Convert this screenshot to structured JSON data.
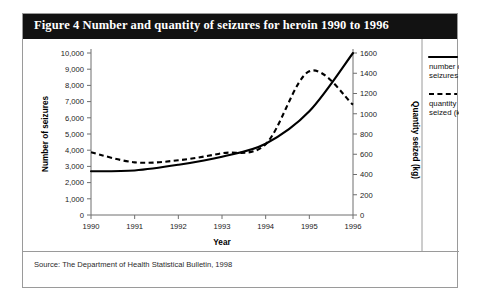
{
  "figure": {
    "title": "Figure 4  Number and quantity of seizures for heroin 1990 to 1996",
    "source": "Source: The Department of Health Statistical Bulletin, 1998"
  },
  "chart_data": {
    "type": "line",
    "title": "Number and quantity of seizures for heroin 1990 to 1996",
    "xlabel": "Year",
    "ylabel": "Number of seizures",
    "y2label": "Quantity seized (kg)",
    "grid": false,
    "legend_position": "right",
    "x": [
      1990,
      1991,
      1992,
      1993,
      1994,
      1995,
      1996
    ],
    "xlim": [
      1990,
      1996
    ],
    "xticks": [
      "1990",
      "1991",
      "1992",
      "1993",
      "1994",
      "1995",
      "1996"
    ],
    "ylim": [
      0,
      10000
    ],
    "yticks": [
      "0",
      "1,000",
      "2,000",
      "3,000",
      "4,000",
      "5,000",
      "6,000",
      "7,000",
      "8,000",
      "9,000",
      "10,000"
    ],
    "y2lim": [
      0,
      1600
    ],
    "y2ticks": [
      "0",
      "200",
      "400",
      "600",
      "800",
      "1000",
      "1200",
      "1400",
      "1600"
    ],
    "series": [
      {
        "name": "number of seizures",
        "axis": "left",
        "style": "solid",
        "units": "seizures",
        "values": [
          2700,
          2750,
          3100,
          3600,
          4400,
          6400,
          10000
        ]
      },
      {
        "name": "quantity seized (kg)",
        "axis": "right",
        "style": "dashed",
        "units": "kg",
        "values": [
          620,
          520,
          540,
          610,
          700,
          1420,
          1090
        ]
      }
    ]
  },
  "legend": {
    "entries": [
      {
        "label_line1": "number of",
        "label_line2": "seizures",
        "style": "solid"
      },
      {
        "label_line1": "quantity",
        "label_line2": "seized (kg)",
        "style": "dashed"
      }
    ]
  }
}
